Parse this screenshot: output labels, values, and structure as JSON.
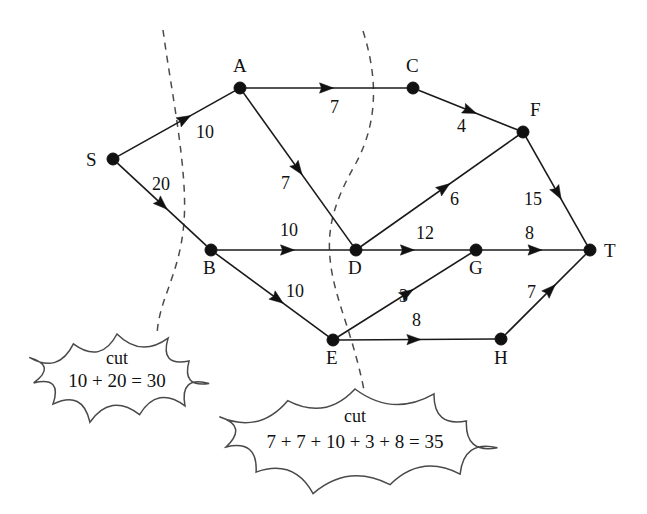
{
  "figure": {
    "type": "flow-network-diagram",
    "width": 647,
    "height": 514,
    "background_color": "#ffffff",
    "ink_color": "#111111",
    "dash_color": "#4b4b4b"
  },
  "nodes": [
    {
      "id": "S",
      "label": "S",
      "x": 113,
      "y": 159,
      "label_x": 86,
      "label_y": 150
    },
    {
      "id": "A",
      "label": "A",
      "x": 240,
      "y": 88,
      "label_x": 233,
      "label_y": 56
    },
    {
      "id": "B",
      "label": "B",
      "x": 211,
      "y": 250,
      "label_x": 203,
      "label_y": 258
    },
    {
      "id": "C",
      "label": "C",
      "x": 413,
      "y": 88,
      "label_x": 406,
      "label_y": 56
    },
    {
      "id": "D",
      "label": "D",
      "x": 356,
      "y": 250,
      "label_x": 348,
      "label_y": 258
    },
    {
      "id": "E",
      "label": "E",
      "x": 333,
      "y": 340,
      "label_x": 326,
      "label_y": 348
    },
    {
      "id": "F",
      "label": "F",
      "x": 523,
      "y": 132,
      "label_x": 530,
      "label_y": 100
    },
    {
      "id": "G",
      "label": "G",
      "x": 476,
      "y": 250,
      "label_x": 469,
      "label_y": 258
    },
    {
      "id": "H",
      "label": "H",
      "x": 501,
      "y": 339,
      "label_x": 494,
      "label_y": 348
    },
    {
      "id": "T",
      "label": "T",
      "x": 590,
      "y": 250,
      "label_x": 604,
      "label_y": 241
    }
  ],
  "edges": [
    {
      "from": "S",
      "to": "A",
      "capacity": "10",
      "label_x": 196,
      "label_y": 123,
      "arrow_t": 0.57
    },
    {
      "from": "S",
      "to": "B",
      "capacity": "20",
      "label_x": 152,
      "label_y": 175,
      "arrow_t": 0.5
    },
    {
      "from": "A",
      "to": "C",
      "capacity": "7",
      "label_x": 330,
      "label_y": 98,
      "arrow_t": 0.5
    },
    {
      "from": "A",
      "to": "D",
      "capacity": "7",
      "label_x": 281,
      "label_y": 174,
      "arrow_t": 0.5
    },
    {
      "from": "B",
      "to": "D",
      "capacity": "10",
      "label_x": 280,
      "label_y": 221,
      "arrow_t": 0.53
    },
    {
      "from": "B",
      "to": "E",
      "capacity": "10",
      "label_x": 286,
      "label_y": 282,
      "arrow_t": 0.55
    },
    {
      "from": "C",
      "to": "F",
      "capacity": "4",
      "label_x": 457,
      "label_y": 117,
      "arrow_t": 0.52
    },
    {
      "from": "D",
      "to": "F",
      "capacity": "6",
      "label_x": 450,
      "label_y": 190,
      "arrow_t": 0.53
    },
    {
      "from": "D",
      "to": "G",
      "capacity": "12",
      "label_x": 416,
      "label_y": 224,
      "arrow_t": 0.42
    },
    {
      "from": "E",
      "to": "G",
      "capacity": "3",
      "label_x": 399,
      "label_y": 287,
      "arrow_t": 0.52
    },
    {
      "from": "E",
      "to": "H",
      "capacity": "8",
      "label_x": 412,
      "label_y": 311,
      "arrow_t": 0.48
    },
    {
      "from": "F",
      "to": "T",
      "capacity": "15",
      "label_x": 524,
      "label_y": 190,
      "arrow_t": 0.52
    },
    {
      "from": "G",
      "to": "T",
      "capacity": "8",
      "label_x": 525,
      "label_y": 224,
      "arrow_t": 0.52
    },
    {
      "from": "H",
      "to": "T",
      "capacity": "7",
      "label_x": 527,
      "label_y": 283,
      "arrow_t": 0.56
    }
  ],
  "cuts": [
    {
      "id": "cut-left",
      "title": "cut",
      "sum_text": "10 + 20 = 30",
      "dash_path": "M 163 30 C 171 90, 188 170, 184 222 C 180 275, 158 300, 157 336",
      "cloud": {
        "cx": 117,
        "cy": 377,
        "rx": 88,
        "ry": 43
      },
      "title_x": 117,
      "title_y": 357,
      "sum_x": 117,
      "sum_y": 379
    },
    {
      "id": "cut-right",
      "title": "cut",
      "sum_text": "7 + 7 + 10 + 3 + 8 = 35",
      "dash_path": "M 363 31 C 378 78, 378 122, 356 163 C 335 200, 327 226, 330 258 C 333 296, 352 330, 364 390",
      "cloud": {
        "cx": 355,
        "cy": 440,
        "rx": 136,
        "ry": 51
      },
      "title_x": 355,
      "title_y": 415,
      "sum_x": 355,
      "sum_y": 440
    }
  ],
  "flow_summary": {
    "source": "S",
    "sink": "T",
    "min_cut_value": "30"
  }
}
